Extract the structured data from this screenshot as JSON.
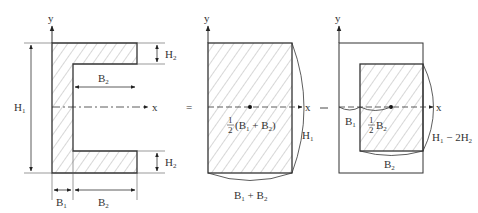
{
  "diagram": {
    "colors": {
      "stroke": "#333333",
      "hatch": "#999999",
      "background": "#ffffff"
    },
    "axes": {
      "y_label": "y",
      "x_label": "x"
    },
    "equals_sign": "=",
    "minus_sign": "−",
    "panel_left": {
      "name": "channel-section",
      "labels": {
        "H1": {
          "main": "H",
          "sub": "1"
        },
        "H2_top": {
          "main": "H",
          "sub": "2"
        },
        "H2_bottom": {
          "main": "H",
          "sub": "2"
        },
        "B2_inner": {
          "main": "B",
          "sub": "2"
        },
        "B1_bottom": {
          "main": "B",
          "sub": "1"
        },
        "B2_bottom": {
          "main": "B",
          "sub": "2"
        }
      }
    },
    "panel_middle": {
      "name": "full-rectangle",
      "centroid_label": {
        "frac_num": "1",
        "frac_den": "2",
        "text": "(B",
        "sub1": "1",
        "plus": " + B",
        "sub2": "2",
        "close": ")"
      },
      "height_label": {
        "main": "H",
        "sub": "1"
      },
      "width_label": {
        "main": "B",
        "sub1": "1",
        "plus": " + B",
        "sub2": "2"
      }
    },
    "panel_right": {
      "name": "inner-cutout-rectangle",
      "offset_label": {
        "main": "B",
        "sub": "1"
      },
      "centroid_label": {
        "frac_num": "1",
        "frac_den": "2",
        "main": "B",
        "sub": "2"
      },
      "height_label": {
        "main": "H",
        "sub1": "1",
        "minus": " − 2H",
        "sub2": "2"
      },
      "width_label": {
        "main": "B",
        "sub": "2"
      }
    }
  }
}
